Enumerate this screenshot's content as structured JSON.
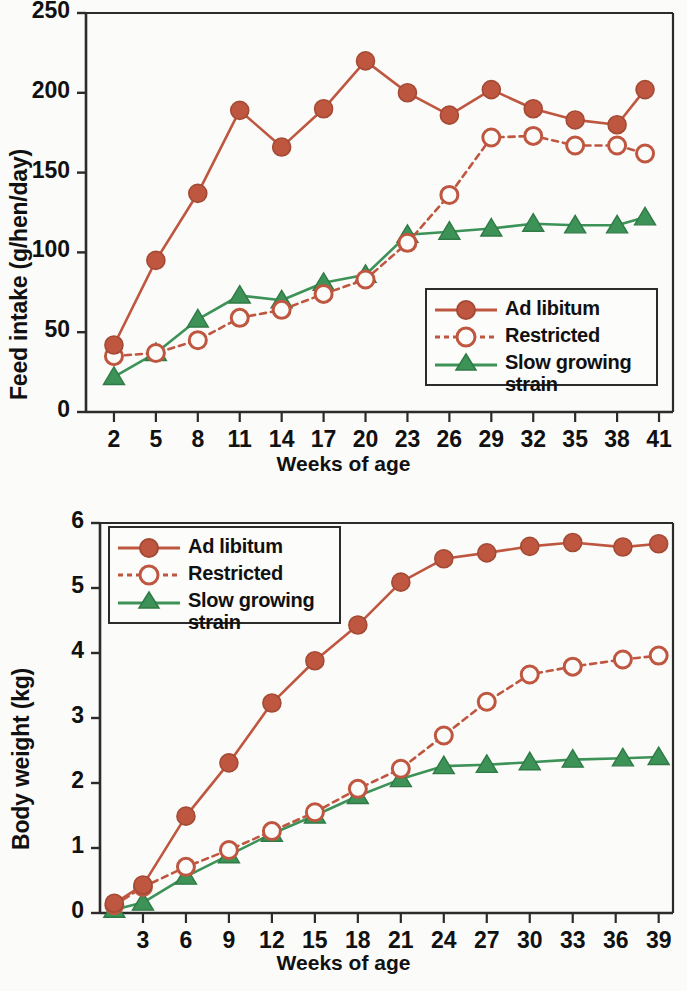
{
  "colors": {
    "ad_libitum": "#bf5740",
    "restricted": "#bf5740",
    "slow_growing": "#3c9257",
    "axis": "#2b2b2b",
    "background": "#fbfbf9"
  },
  "legend": {
    "ad_libitum": "Ad libitum",
    "restricted": "Restricted",
    "slow_growing": "Slow growing\nstrain"
  },
  "chart_data": [
    {
      "id": "feed-intake",
      "type": "line",
      "title": "",
      "xlabel": "Weeks of age",
      "ylabel": "Feed intake (g/hen/day)",
      "xlim": [
        0,
        42
      ],
      "ylim": [
        0,
        250
      ],
      "xticks": [
        2,
        5,
        8,
        11,
        14,
        17,
        20,
        23,
        26,
        29,
        32,
        35,
        38,
        41
      ],
      "yticks": [
        0,
        50,
        100,
        150,
        200,
        250
      ],
      "grid": false,
      "legend_position": "bottom-right",
      "x": [
        2,
        5,
        8,
        11,
        14,
        17,
        20,
        23,
        26,
        29,
        32,
        35,
        38,
        40
      ],
      "series": [
        {
          "name": "Ad libitum",
          "marker": "filled-circle",
          "line": "solid",
          "color": "#bf5740",
          "values": [
            42,
            95,
            137,
            189,
            166,
            190,
            220,
            200,
            186,
            202,
            190,
            183,
            180,
            202
          ]
        },
        {
          "name": "Restricted",
          "marker": "open-circle",
          "line": "dashed",
          "color": "#bf5740",
          "values": [
            35,
            37,
            45,
            59,
            64,
            74,
            83,
            106,
            136,
            172,
            173,
            167,
            167,
            162
          ]
        },
        {
          "name": "Slow growing strain",
          "marker": "filled-triangle",
          "line": "solid",
          "color": "#3c9257",
          "values": [
            22,
            37,
            58,
            73,
            70,
            81,
            86,
            111,
            113,
            115,
            118,
            117,
            117,
            122
          ]
        }
      ]
    },
    {
      "id": "body-weight",
      "type": "line",
      "title": "",
      "xlabel": "Weeks of age",
      "ylabel": "Body weight (kg)",
      "xlim": [
        0,
        40
      ],
      "ylim": [
        0,
        6
      ],
      "xticks": [
        3,
        6,
        9,
        12,
        15,
        18,
        21,
        24,
        27,
        30,
        33,
        36,
        39
      ],
      "yticks": [
        0,
        1,
        2,
        3,
        4,
        5,
        6
      ],
      "grid": false,
      "legend_position": "top-left",
      "x": [
        1,
        3,
        6,
        9,
        12,
        15,
        18,
        21,
        24,
        27,
        30,
        33,
        36.5,
        39
      ],
      "series": [
        {
          "name": "Ad libitum",
          "marker": "filled-circle",
          "line": "solid",
          "color": "#bf5740",
          "values": [
            0.15,
            0.43,
            1.49,
            2.31,
            3.23,
            3.88,
            4.43,
            5.09,
            5.45,
            5.54,
            5.64,
            5.7,
            5.63,
            5.68
          ]
        },
        {
          "name": "Restricted",
          "marker": "open-circle",
          "line": "dashed",
          "color": "#bf5740",
          "values": [
            0.12,
            0.4,
            0.71,
            0.97,
            1.26,
            1.55,
            1.91,
            2.22,
            2.73,
            3.25,
            3.67,
            3.79,
            3.9,
            3.96
          ]
        },
        {
          "name": "Slow growing strain",
          "marker": "filled-triangle",
          "line": "solid",
          "color": "#3c9257",
          "values": [
            0.05,
            0.16,
            0.56,
            0.89,
            1.22,
            1.5,
            1.8,
            2.06,
            2.26,
            2.28,
            2.32,
            2.36,
            2.38,
            2.4
          ]
        }
      ]
    }
  ]
}
